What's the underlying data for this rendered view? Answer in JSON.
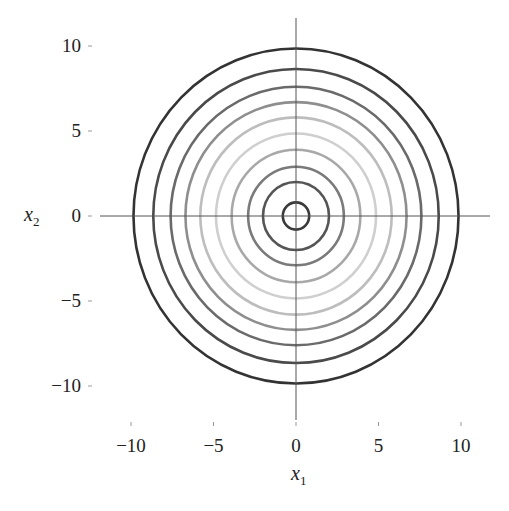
{
  "chart_data": {
    "type": "contour",
    "title": "",
    "xlabel": "x1",
    "ylabel": "x2",
    "xlim": [
      -12,
      12
    ],
    "ylim": [
      -12,
      12
    ],
    "x_ticks": [
      -10,
      -5,
      0,
      5,
      10
    ],
    "y_ticks": [
      10,
      5,
      0,
      -5,
      -10
    ],
    "x_tick_labels": [
      "−10",
      "−5",
      "0",
      "5",
      "10"
    ],
    "y_tick_labels": [
      "10",
      "5",
      "0",
      "−5",
      "−10"
    ],
    "grid": false,
    "legend": null,
    "center": [
      0,
      0
    ],
    "contours": [
      {
        "radius": 0.8,
        "color": "#3a3a3a"
      },
      {
        "radius": 2.0,
        "color": "#555555"
      },
      {
        "radius": 2.9,
        "color": "#7a7a7a"
      },
      {
        "radius": 3.9,
        "color": "#a8a8a8"
      },
      {
        "radius": 4.85,
        "color": "#cfcfcf"
      },
      {
        "radius": 5.8,
        "color": "#bdbdbd"
      },
      {
        "radius": 6.7,
        "color": "#8e8e8e"
      },
      {
        "radius": 7.6,
        "color": "#6a6a6a"
      },
      {
        "radius": 8.65,
        "color": "#4a4a4a"
      },
      {
        "radius": 9.85,
        "color": "#333333"
      }
    ]
  },
  "axes": {
    "xlabel_main": "x",
    "xlabel_sub": "1",
    "ylabel_main": "x",
    "ylabel_sub": "2"
  }
}
